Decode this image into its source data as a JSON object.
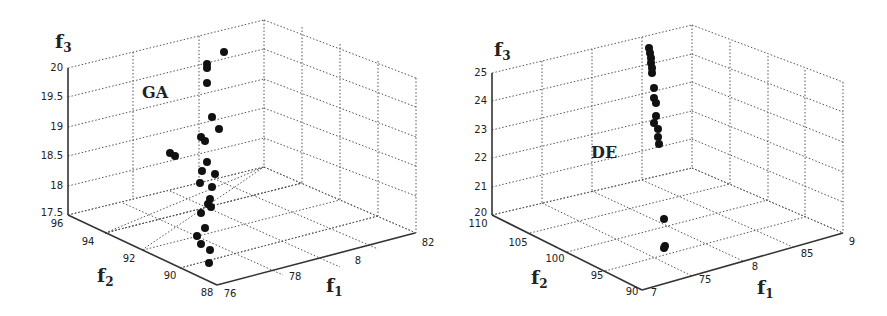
{
  "chart_data": [
    {
      "type": "scatter",
      "projection": "3d",
      "title": "GA",
      "xlabel": "f1",
      "ylabel": "f2",
      "zlabel": "f3",
      "xlim": [
        7.6,
        8.2
      ],
      "ylim": [
        88,
        96
      ],
      "zlim": [
        17.5,
        20
      ],
      "xticks": [
        "76",
        "78",
        "8",
        "82"
      ],
      "yticks": [
        "88",
        "90",
        "92",
        "94",
        "96"
      ],
      "zticks": [
        "17.5",
        "18",
        "18.5",
        "19",
        "19.5",
        "20"
      ],
      "grid": true,
      "points_screen": [
        [
          224,
          52
        ],
        [
          207,
          64
        ],
        [
          207,
          68
        ],
        [
          207,
          83
        ],
        [
          212,
          117
        ],
        [
          219,
          129
        ],
        [
          201,
          137
        ],
        [
          205,
          141
        ],
        [
          170,
          153
        ],
        [
          175,
          156
        ],
        [
          207,
          162
        ],
        [
          202,
          171
        ],
        [
          215,
          174
        ],
        [
          200,
          183
        ],
        [
          212,
          187
        ],
        [
          210,
          199
        ],
        [
          208,
          204
        ],
        [
          211,
          207
        ],
        [
          201,
          213
        ],
        [
          205,
          228
        ],
        [
          197,
          236
        ],
        [
          201,
          244
        ],
        [
          210,
          250
        ],
        [
          209,
          263
        ]
      ]
    },
    {
      "type": "scatter",
      "projection": "3d",
      "title": "DE",
      "xlabel": "f1",
      "ylabel": "f2",
      "zlabel": "f3",
      "xlim": [
        7,
        9
      ],
      "ylim": [
        90,
        110
      ],
      "zlim": [
        20,
        25
      ],
      "xticks": [
        "7",
        "75",
        "8",
        "85",
        "9"
      ],
      "yticks": [
        "90",
        "95",
        "100",
        "105",
        "110"
      ],
      "zticks": [
        "20",
        "21",
        "22",
        "23",
        "24",
        "25"
      ],
      "grid": true,
      "points_screen": [
        [
          649,
          48
        ],
        [
          650,
          53
        ],
        [
          651,
          58
        ],
        [
          651,
          63
        ],
        [
          652,
          68
        ],
        [
          652,
          73
        ],
        [
          654,
          88
        ],
        [
          654,
          98
        ],
        [
          656,
          103
        ],
        [
          656,
          116
        ],
        [
          654,
          123
        ],
        [
          658,
          129
        ],
        [
          658,
          137
        ],
        [
          659,
          144
        ],
        [
          664,
          219
        ],
        [
          665,
          246
        ],
        [
          664,
          248
        ]
      ]
    }
  ],
  "labels": {
    "ga": {
      "title": "GA",
      "f1": "f",
      "f1_sub": "1",
      "f2": "f",
      "f2_sub": "2",
      "f3": "f",
      "f3_sub": "3"
    },
    "de": {
      "title": "DE",
      "f1": "f",
      "f1_sub": "1",
      "f2": "f",
      "f2_sub": "2",
      "f3": "f",
      "f3_sub": "3"
    }
  },
  "ticks": {
    "ga": {
      "z": [
        "20",
        "19.5",
        "19",
        "18.5",
        "18",
        "17.5"
      ],
      "y": [
        "96",
        "94",
        "92",
        "90",
        "88"
      ],
      "x": [
        "76",
        "78",
        "8",
        "82"
      ]
    },
    "de": {
      "z": [
        "25",
        "24",
        "23",
        "22",
        "21",
        "20"
      ],
      "y": [
        "110",
        "105",
        "100",
        "95",
        "90"
      ],
      "x": [
        "7",
        "75",
        "8",
        "85",
        "9"
      ]
    }
  }
}
